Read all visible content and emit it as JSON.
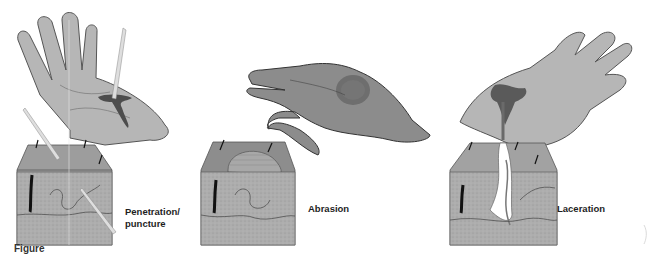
{
  "figure": {
    "caption_partial": "Figure",
    "colors": {
      "skin_light": "#b4b4b4",
      "skin_dark": "#8a8a8a",
      "tissue": "#a9a9a9",
      "blood": "#555555",
      "outline": "#3a3a3a",
      "hair": "#111111",
      "background": "#ffffff"
    },
    "panels": [
      {
        "id": "puncture",
        "label_line1": "Penetration/",
        "label_line2": "puncture"
      },
      {
        "id": "abrasion",
        "label": "Abrasion"
      },
      {
        "id": "laceration",
        "label": "Laceration"
      }
    ]
  }
}
